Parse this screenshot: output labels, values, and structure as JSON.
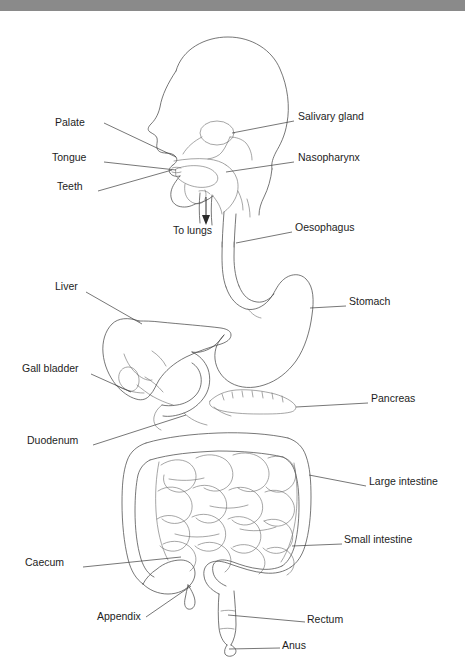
{
  "window": {
    "title": "",
    "bar_color": "#8a8a8a",
    "background": "#ffffff"
  },
  "figure": {
    "type": "anatomical-line-diagram",
    "stroke_color": "#4a4a4a",
    "leader_color": "#3c3c3c",
    "text_color": "#1d1d1d",
    "width": 465,
    "height": 660
  },
  "labels": [
    {
      "id": "palate",
      "text": "Palate",
      "side": "left",
      "x": 60,
      "y": 111,
      "anchor_x": 175,
      "anchor_y": 143
    },
    {
      "id": "tongue",
      "text": "Tongue",
      "side": "left",
      "x": 57,
      "y": 146,
      "anchor_x": 172,
      "anchor_y": 159
    },
    {
      "id": "teeth",
      "text": "Teeth",
      "side": "left",
      "x": 62,
      "y": 174,
      "anchor_x": 168,
      "anchor_y": 160
    },
    {
      "id": "salivary-gland",
      "text": "Salivary gland",
      "side": "right",
      "x": 299,
      "y": 106,
      "anchor_x": 214,
      "anchor_y": 124
    },
    {
      "id": "nasopharynx",
      "text": "Nasopharynx",
      "side": "right",
      "x": 299,
      "y": 146,
      "anchor_x": 221,
      "anchor_y": 164
    },
    {
      "id": "oesophagus",
      "text": "Oesophagus",
      "side": "right",
      "x": 295,
      "y": 216,
      "anchor_x": 213,
      "anchor_y": 230
    },
    {
      "id": "to-lungs",
      "text": "To lungs",
      "side": "below",
      "x": 174,
      "y": 220,
      "anchor_x": 210,
      "anchor_y": 200
    },
    {
      "id": "liver",
      "text": "Liver",
      "side": "left",
      "x": 57,
      "y": 275,
      "anchor_x": 139,
      "anchor_y": 310
    },
    {
      "id": "gall-bladder",
      "text": "Gall bladder",
      "side": "left",
      "x": 25,
      "y": 357,
      "anchor_x": 129,
      "anchor_y": 380
    },
    {
      "id": "duodenum",
      "text": "Duodenum",
      "side": "left",
      "x": 30,
      "y": 429,
      "anchor_x": 147,
      "anchor_y": 402
    },
    {
      "id": "stomach",
      "text": "Stomach",
      "side": "right",
      "x": 350,
      "y": 290,
      "anchor_x": 305,
      "anchor_y": 297
    },
    {
      "id": "pancreas",
      "text": "Pancreas",
      "side": "right",
      "x": 372,
      "y": 387,
      "anchor_x": 295,
      "anchor_y": 391
    },
    {
      "id": "large-intestine",
      "text": "Large intestine",
      "side": "right",
      "x": 370,
      "y": 470,
      "anchor_x": 311,
      "anchor_y": 461
    },
    {
      "id": "small-intestine",
      "text": "Small intestine",
      "side": "right",
      "x": 345,
      "y": 528,
      "anchor_x": 290,
      "anchor_y": 534
    },
    {
      "id": "caecum",
      "text": "Caecum",
      "side": "left",
      "x": 27,
      "y": 551,
      "anchor_x": 160,
      "anchor_y": 543
    },
    {
      "id": "appendix",
      "text": "Appendix",
      "side": "left",
      "x": 98,
      "y": 605,
      "anchor_x": 188,
      "anchor_y": 570
    },
    {
      "id": "rectum",
      "text": "Rectum",
      "side": "right",
      "x": 308,
      "y": 608,
      "anchor_x": 235,
      "anchor_y": 606
    },
    {
      "id": "anus",
      "text": "Anus",
      "side": "right",
      "x": 283,
      "y": 634,
      "anchor_x": 230,
      "anchor_y": 634
    }
  ]
}
